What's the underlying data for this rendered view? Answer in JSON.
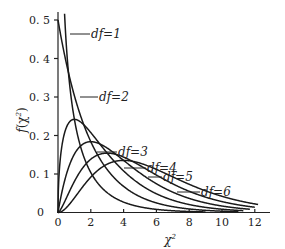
{
  "chart_data": {
    "type": "line",
    "title": "",
    "xlabel": "χ²",
    "ylabel": "f(χ²)",
    "xlim": [
      0,
      12.5
    ],
    "ylim": [
      0,
      0.52
    ],
    "grid": false,
    "legend_position": "inline labels with leader lines",
    "x_ticks": [
      "0",
      "2",
      "4",
      "6",
      "8",
      "10",
      "12"
    ],
    "y_ticks": [
      "0",
      "0.1",
      "0.2",
      "0.3",
      "0.4",
      "0.5"
    ],
    "series": [
      {
        "name": "df=1",
        "df": 1,
        "label": "df=1",
        "peak": {
          "x": 0,
          "y": "→∞"
        }
      },
      {
        "name": "df=2",
        "df": 2,
        "label": "df=2",
        "peak": {
          "x": 0,
          "y": 0.5
        }
      },
      {
        "name": "df=3",
        "df": 3,
        "label": "df=3",
        "peak": {
          "x": 1,
          "y": 0.24
        }
      },
      {
        "name": "df=4",
        "df": 4,
        "label": "df=4",
        "peak": {
          "x": 2,
          "y": 0.18
        }
      },
      {
        "name": "df=5",
        "df": 5,
        "label": "df=5",
        "peak": {
          "x": 3,
          "y": 0.154
        }
      },
      {
        "name": "df=6",
        "df": 6,
        "label": "df=6",
        "peak": {
          "x": 4,
          "y": 0.135
        }
      }
    ]
  },
  "axes": {
    "x_label": "χ",
    "x_label_sup": "2",
    "y_label_f": "f",
    "y_label_chi": "(χ",
    "y_label_sup": "2",
    "y_label_close": ")"
  },
  "labels": {
    "df1": "df=1",
    "df2": "df=2",
    "df3": "df=3",
    "df4": "df=4",
    "df5": "df=5",
    "df6": "df=6"
  },
  "ticks": {
    "x": [
      "0",
      "2",
      "4",
      "6",
      "8",
      "10",
      "12"
    ],
    "y": [
      "0",
      "0. 1",
      "0. 2",
      "0. 3",
      "0. 4",
      "0. 5"
    ]
  }
}
